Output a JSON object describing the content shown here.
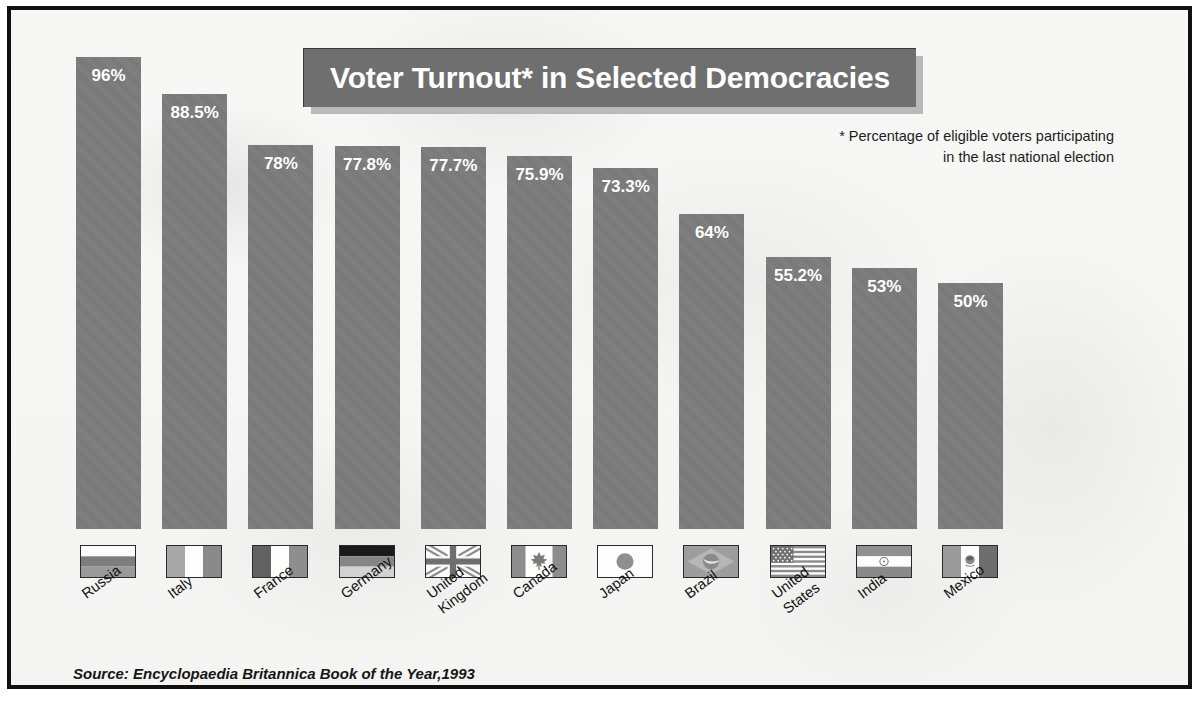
{
  "title": "Voter Turnout* in Selected Democracies",
  "footnote_line1": "* Percentage of eligible voters participating",
  "footnote_line2": "in the last national election",
  "source": "Source: Encyclopaedia Britannica Book of the Year,1993",
  "colors": {
    "bar": "#7b7b7b",
    "title_box": "#6f6f6f",
    "title_shadow": "#b9b9b9",
    "background": "#f6f6f4",
    "frame": "#111111",
    "value_label": "#ffffff"
  },
  "chart_data": {
    "type": "bar",
    "title": "Voter Turnout* in Selected Democracies",
    "xlabel": "",
    "ylabel": "",
    "ylim": [
      0,
      100
    ],
    "grid": false,
    "legend": "none",
    "value_suffix": "%",
    "annotations": [
      "* Percentage of eligible voters participating in the last national election",
      "Source: Encyclopaedia Britannica Book of the Year,1993"
    ],
    "categories": [
      "Russia",
      "Italy",
      "France",
      "Germany",
      "United Kingdom",
      "Canada",
      "Japan",
      "Brazil",
      "United States",
      "India",
      "Mexico"
    ],
    "values": [
      96,
      88.5,
      78,
      77.8,
      77.7,
      75.9,
      73.3,
      64,
      55.2,
      53,
      50
    ],
    "value_labels": [
      "96%",
      "88.5%",
      "78%",
      "77.8%",
      "77.7%",
      "75.9%",
      "73.3%",
      "64%",
      "55.2%",
      "53%",
      "50%"
    ]
  },
  "bars": [
    {
      "country": "Russia",
      "label_lines": [
        "Russia"
      ],
      "value_label": "96%",
      "flag": "flag-russia"
    },
    {
      "country": "Italy",
      "label_lines": [
        "Italy"
      ],
      "value_label": "88.5%",
      "flag": "flag-italy"
    },
    {
      "country": "France",
      "label_lines": [
        "France"
      ],
      "value_label": "78%",
      "flag": "flag-france"
    },
    {
      "country": "Germany",
      "label_lines": [
        "Germany"
      ],
      "value_label": "77.8%",
      "flag": "flag-germany"
    },
    {
      "country": "United Kingdom",
      "label_lines": [
        "United",
        "Kingdom"
      ],
      "value_label": "77.7%",
      "flag": "flag-united-kingdom"
    },
    {
      "country": "Canada",
      "label_lines": [
        "Canada"
      ],
      "value_label": "75.9%",
      "flag": "flag-canada"
    },
    {
      "country": "Japan",
      "label_lines": [
        "Japan"
      ],
      "value_label": "73.3%",
      "flag": "flag-japan"
    },
    {
      "country": "Brazil",
      "label_lines": [
        "Brazil"
      ],
      "value_label": "64%",
      "flag": "flag-brazil"
    },
    {
      "country": "United States",
      "label_lines": [
        "United",
        "States"
      ],
      "value_label": "55.2%",
      "flag": "flag-united-states"
    },
    {
      "country": "India",
      "label_lines": [
        "India"
      ],
      "value_label": "53%",
      "flag": "flag-india"
    },
    {
      "country": "Mexico",
      "label_lines": [
        "Mexico"
      ],
      "value_label": "50%",
      "flag": "flag-mexico"
    }
  ]
}
